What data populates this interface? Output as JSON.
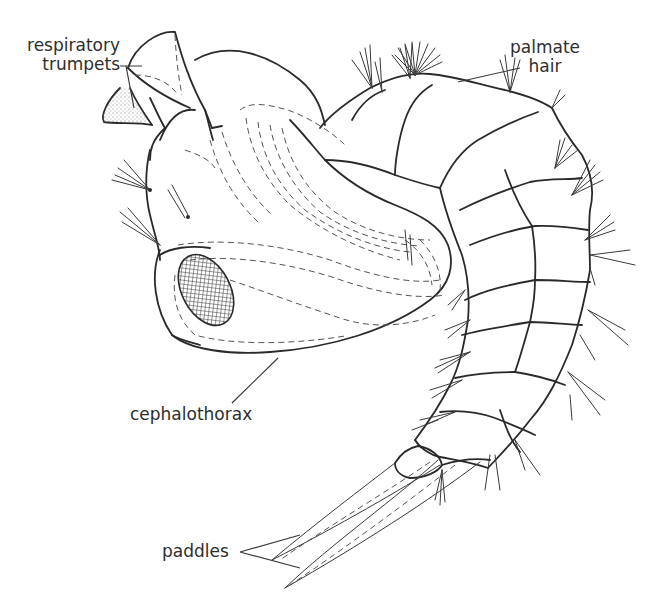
{
  "figure": {
    "labels": {
      "respiratory_trumpets": {
        "line1": "respiratory",
        "line2": "trumpets"
      },
      "palmate_hair": {
        "line1": "palmate",
        "line2": "hair"
      },
      "cephalothorax": "cephalothorax",
      "paddles": "paddles"
    },
    "colors": {
      "ink": "#2a2a2a",
      "background": "#ffffff",
      "label_text": "#2e2e2e"
    }
  }
}
